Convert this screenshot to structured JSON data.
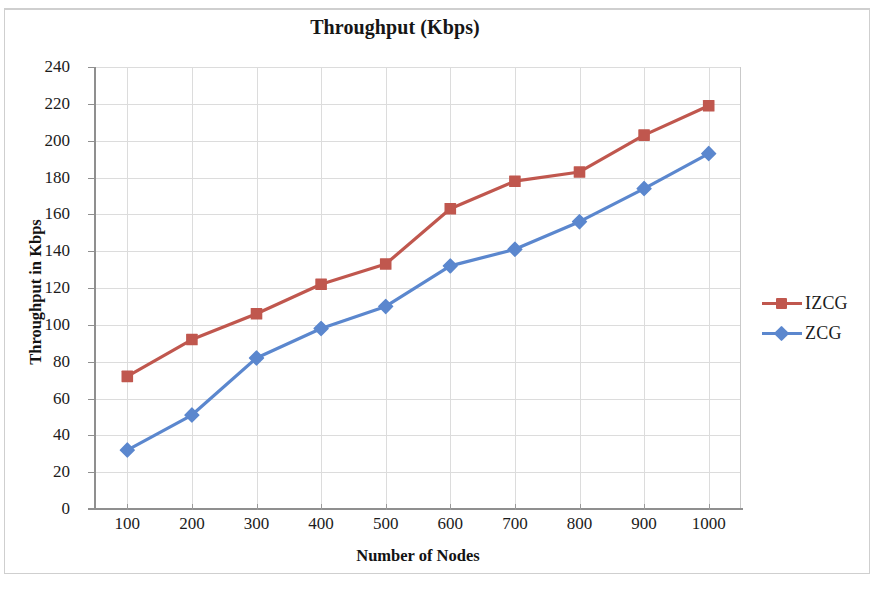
{
  "chart_data": {
    "type": "line",
    "title": "Throughput (Kbps)",
    "xlabel": "Number of Nodes",
    "ylabel": "Throughput in Kbps",
    "x": [
      100,
      200,
      300,
      400,
      500,
      600,
      700,
      800,
      900,
      1000
    ],
    "xtick_labels": [
      "100",
      "200",
      "300",
      "400",
      "500",
      "600",
      "700",
      "800",
      "900",
      "1000"
    ],
    "ytick_labels": [
      "240",
      "220",
      "200",
      "180",
      "160",
      "140",
      "120",
      "100",
      "80",
      "60",
      "40",
      "20",
      "0"
    ],
    "yticks": [
      240,
      220,
      200,
      180,
      160,
      140,
      120,
      100,
      80,
      60,
      40,
      20,
      0
    ],
    "xlim": [
      50,
      1050
    ],
    "ylim": [
      0,
      240
    ],
    "grid": true,
    "legend_position": "right",
    "series": [
      {
        "name": "IZCG",
        "color": "#C0574E",
        "marker": "square",
        "values": [
          72,
          92,
          106,
          122,
          133,
          163,
          178,
          183,
          203,
          219
        ]
      },
      {
        "name": "ZCG",
        "color": "#5B87CE",
        "marker": "diamond",
        "values": [
          32,
          51,
          82,
          98,
          110,
          132,
          141,
          156,
          174,
          193
        ]
      }
    ]
  },
  "legend": {
    "items": [
      {
        "label": "IZCG"
      },
      {
        "label": "ZCG"
      }
    ]
  },
  "colors": {
    "izcg": "#C0574E",
    "zcg": "#5B87CE",
    "grid": "#dcdcdc",
    "axis": "#8f8f8f",
    "text": "#1b1b1b"
  }
}
